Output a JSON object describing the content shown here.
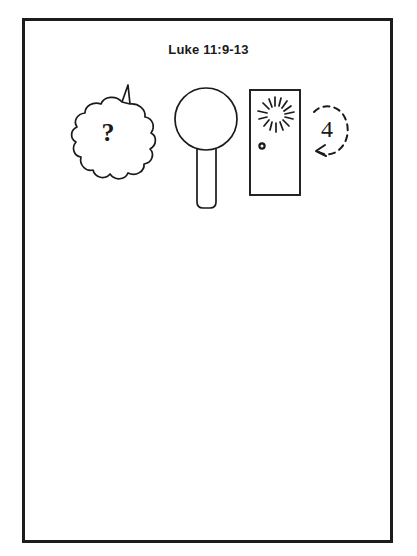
{
  "page": {
    "background_color": "#ffffff",
    "ink_color": "#1a1a1a",
    "width": 417,
    "height": 556
  },
  "frame": {
    "name": "worksheet-border",
    "style": "thick black rectangle",
    "color": "#1c1c1c"
  },
  "header": {
    "title": "Luke 11:9-13"
  },
  "figures": [
    {
      "id": "cloud",
      "icon": "thought-cloud-icon",
      "label": "?",
      "description": "thought bubble cloud with question mark"
    },
    {
      "id": "lollipop",
      "icon": "lollipop-icon",
      "label": "",
      "description": "circle on a straight handle"
    },
    {
      "id": "door",
      "icon": "door-icon",
      "label": "",
      "description": "door rectangle with knocking burst and round knob"
    },
    {
      "id": "arrow",
      "icon": "circular-arrow-icon",
      "label": "4",
      "description": "dashed circular arrow enclosing the number four"
    }
  ]
}
